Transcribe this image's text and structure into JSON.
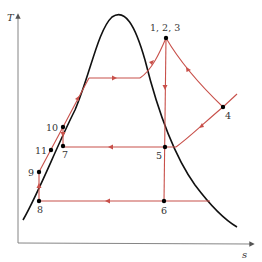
{
  "diagram": {
    "type": "T-s diagram",
    "axes": {
      "y_label": "T",
      "x_label": "s"
    },
    "colors": {
      "dome": "#111111",
      "process": "#c8504a",
      "axis": "#666666",
      "point": "#000000",
      "text": "#333333"
    },
    "points": [
      {
        "id": "p123",
        "label": "1, 2, 3",
        "x": 166,
        "y": 38,
        "lx": 150,
        "ly": 31
      },
      {
        "id": "p4",
        "label": "4",
        "x": 223,
        "y": 107,
        "lx": 225,
        "ly": 119
      },
      {
        "id": "p5",
        "label": "5",
        "x": 165,
        "y": 147,
        "lx": 156,
        "ly": 159
      },
      {
        "id": "p6",
        "label": "6",
        "x": 164,
        "y": 201,
        "lx": 161,
        "ly": 214
      },
      {
        "id": "p7",
        "label": "7",
        "x": 63,
        "y": 146,
        "lx": 62,
        "ly": 158
      },
      {
        "id": "p8",
        "label": "8",
        "x": 39,
        "y": 201,
        "lx": 37,
        "ly": 213
      },
      {
        "id": "p9",
        "label": "9",
        "x": 39,
        "y": 172,
        "lx": 28,
        "ly": 176
      },
      {
        "id": "p10",
        "label": "10",
        "x": 63,
        "y": 127,
        "lx": 46,
        "ly": 131
      },
      {
        "id": "p11",
        "label": "11",
        "x": 51,
        "y": 150,
        "lx": 35,
        "ly": 154
      }
    ]
  }
}
